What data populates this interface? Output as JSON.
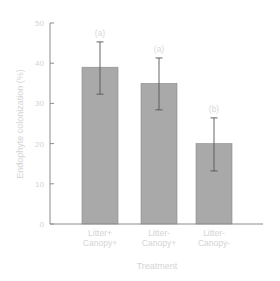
{
  "chart_data": {
    "type": "bar",
    "title": "",
    "xlabel": "Treatment",
    "ylabel": "Endophyte colonization (%)",
    "ylim": [
      0,
      50
    ],
    "yticks": [
      0,
      10,
      20,
      30,
      40,
      50
    ],
    "grid": false,
    "legend": null,
    "categories": [
      [
        "Litter+",
        "Canopy+"
      ],
      [
        "Litter-",
        "Canopy+"
      ],
      [
        "Litter-",
        "Canopy-"
      ]
    ],
    "values": [
      39,
      35,
      20
    ],
    "error_bars": [
      {
        "low": 32.3,
        "high": 45.3
      },
      {
        "low": 28.4,
        "high": 41.3
      },
      {
        "low": 13.2,
        "high": 26.4
      }
    ],
    "annotations": [
      "(a)",
      "(a)",
      "(b)"
    ],
    "colors": {
      "bar": "#a9a9a9",
      "bar_edge": "#8a8a8a",
      "axis": "#8c8c8c",
      "text": "#d4d4d4",
      "errorbar": "#555555"
    }
  }
}
